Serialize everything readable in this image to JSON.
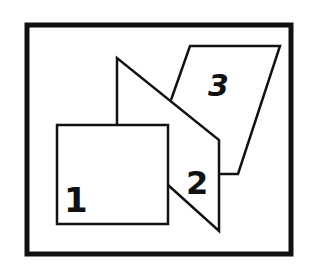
{
  "diagram": {
    "frame": {
      "x": 25,
      "y": 23,
      "width": 268,
      "height": 233,
      "stroke_width": 5
    },
    "colors": {
      "stroke": "#111111",
      "fill": "#ffffff"
    },
    "panels": [
      {
        "id": "panel-1",
        "label": "1",
        "shape": "rectangle",
        "layer": "front"
      },
      {
        "id": "panel-2",
        "label": "2",
        "shape": "trapezoid",
        "layer": "middle"
      },
      {
        "id": "panel-3",
        "label": "3",
        "shape": "parallelogram",
        "layer": "back"
      }
    ]
  }
}
